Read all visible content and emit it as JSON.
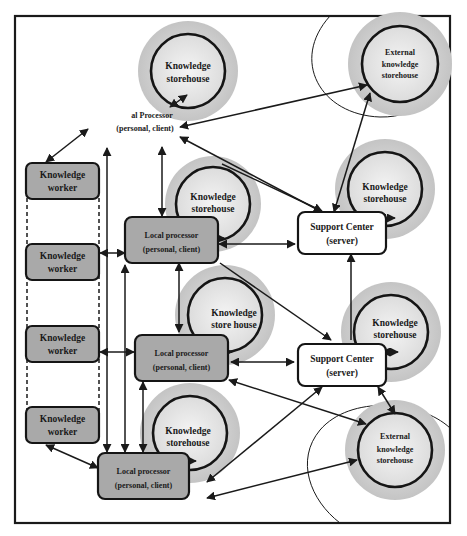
{
  "diagram": {
    "title": "",
    "nodes": {
      "top_processor": {
        "line1": "al Processor",
        "line2": "(personal, client)"
      },
      "storehouse_top": {
        "line1": "Knowledge",
        "line2": "storehouse"
      },
      "external_top": {
        "line1": "External",
        "line2": "knowledge",
        "line3": "storehouse"
      },
      "worker_1": {
        "line1": "Knowledge",
        "line2": "worker"
      },
      "worker_2": {
        "line1": "Knowledge",
        "line2": "worker"
      },
      "worker_3": {
        "line1": "Knowledge",
        "line2": "worker"
      },
      "worker_4": {
        "line1": "Knowledge",
        "line2": "worker"
      },
      "storehouse_1": {
        "line1": "Knowledge",
        "line2": "storehouse"
      },
      "storehouse_2": {
        "line1": "Knowledge",
        "line2": "store house"
      },
      "storehouse_3": {
        "line1": "Knowledge",
        "line2": "storehouse"
      },
      "processor_1": {
        "line1": "Local processor",
        "line2": "(personal, client)"
      },
      "processor_2": {
        "line1": "Local processor",
        "line2": "(personal, client)"
      },
      "processor_3": {
        "line1": "Local processor",
        "line2": "(personal, client)"
      },
      "support_1": {
        "line1": "Support Center",
        "line2": "(server)"
      },
      "support_2": {
        "line1": "Support Center",
        "line2": "(server)"
      },
      "storehouse_right_1": {
        "line1": "Knowledge",
        "line2": "storehouse"
      },
      "storehouse_right_2": {
        "line1": "Knowledge",
        "line2": "storehouse"
      },
      "external_bottom": {
        "line1": "External",
        "line2": "knowledge",
        "line3": "storehouse"
      }
    },
    "colors": {
      "box_grey": "#a9a9a9",
      "halo_grey": "#c8c8c8",
      "stroke": "#151515"
    }
  }
}
